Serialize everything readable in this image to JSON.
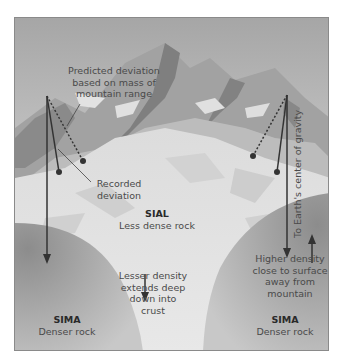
{
  "diagram": {
    "type": "isostasy-plumb-line-deviation",
    "labels": {
      "predicted": [
        "Predicted deviation",
        "based on mass of",
        "mountain range"
      ],
      "recorded": [
        "Recorded",
        "deviation"
      ],
      "sial_title": "SIAL",
      "sial_desc": "Less dense rock",
      "lesser_density": [
        "Lesser density",
        "extends deep",
        "down into",
        "crust"
      ],
      "gravity": "To Earth's center of gravity",
      "higher_density": [
        "Higher density",
        "close to surface",
        "away from",
        "mountain"
      ],
      "sima_left_title": "SIMA",
      "sima_left_desc": "Denser rock",
      "sima_right_title": "SIMA",
      "sima_right_desc": "Denser rock"
    },
    "colors": {
      "sky_top": "#a8a8a8",
      "sky_bottom": "#d8d8d8",
      "mountain_dark": "#8e8e8e",
      "mountain_mid": "#b4b4b4",
      "snow": "#e6e6e6",
      "sima": "#9c9c9c",
      "line": "#333333",
      "frame": "#8a8a8a"
    }
  }
}
